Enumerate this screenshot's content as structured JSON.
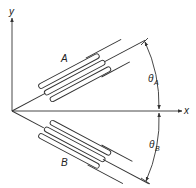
{
  "diagram": {
    "type": "strain-gauge-orientation",
    "axes": {
      "x_label": "x",
      "y_label": "y"
    },
    "gauges": [
      {
        "label": "A",
        "angle_label": "θ",
        "angle_subscript": "A",
        "position": "above x-axis"
      },
      {
        "label": "B",
        "angle_label": "θ",
        "angle_subscript": "B",
        "position": "below x-axis"
      }
    ],
    "colors": {
      "stroke": "#333333",
      "background": "#ffffff"
    }
  }
}
